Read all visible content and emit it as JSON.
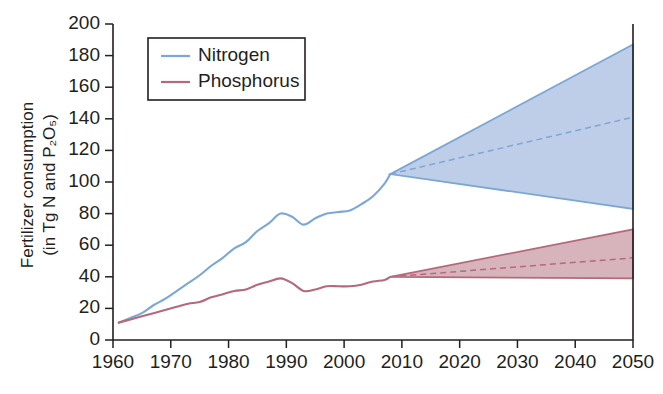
{
  "chart_data": {
    "type": "line",
    "title": "",
    "xlabel": "",
    "ylabel": "Fertilizer consumption (in Tg N and P2O5)",
    "ylabel_line1": "Fertilizer consumption",
    "ylabel_line2": "(in Tg N and P₂O₅)",
    "xlim": [
      1960,
      2050
    ],
    "ylim": [
      0,
      200
    ],
    "xticks": [
      1960,
      1970,
      1980,
      1990,
      2000,
      2010,
      2020,
      2030,
      2040,
      2050
    ],
    "yticks": [
      0,
      20,
      40,
      60,
      80,
      100,
      120,
      140,
      160,
      180,
      200
    ],
    "grid": false,
    "legend_position": "top-left",
    "legend": [
      {
        "label": "Nitrogen",
        "color": "#7BA7D7"
      },
      {
        "label": "Phosphorus",
        "color": "#B5697A"
      }
    ],
    "colors": {
      "nitrogen_line": "#7BA7D7",
      "nitrogen_fill": "#A8BEE2",
      "phosphorus_line": "#B5697A",
      "phosphorus_fill": "#C99AA4",
      "axis": "#231f20"
    },
    "projection_start_year": 2008,
    "series": [
      {
        "name": "Nitrogen",
        "kind": "historical",
        "x": [
          1961,
          1963,
          1965,
          1967,
          1969,
          1971,
          1973,
          1975,
          1977,
          1979,
          1981,
          1983,
          1985,
          1987,
          1989,
          1991,
          1993,
          1995,
          1997,
          1999,
          2001,
          2003,
          2005,
          2007,
          2008
        ],
        "values": [
          11,
          14,
          17,
          22,
          26,
          31,
          36,
          41,
          47,
          52,
          58,
          62,
          69,
          74,
          80,
          78,
          73,
          77,
          80,
          81,
          82,
          86,
          91,
          99,
          105
        ]
      },
      {
        "name": "Phosphorus",
        "kind": "historical",
        "x": [
          1961,
          1963,
          1965,
          1967,
          1969,
          1971,
          1973,
          1975,
          1977,
          1979,
          1981,
          1983,
          1985,
          1987,
          1989,
          1991,
          1993,
          1995,
          1997,
          1999,
          2001,
          2003,
          2005,
          2007,
          2008
        ],
        "values": [
          11,
          13,
          15,
          17,
          19,
          21,
          23,
          24,
          27,
          29,
          31,
          32,
          35,
          37,
          39,
          36,
          31,
          32,
          34,
          34,
          34,
          35,
          37,
          38,
          40
        ]
      },
      {
        "name": "Nitrogen projection",
        "kind": "projection_band",
        "x": [
          2008,
          2050
        ],
        "upper": [
          105,
          187
        ],
        "median": [
          105,
          141
        ],
        "lower": [
          105,
          83
        ]
      },
      {
        "name": "Phosphorus projection",
        "kind": "projection_band",
        "x": [
          2008,
          2050
        ],
        "upper": [
          40,
          70
        ],
        "median": [
          40,
          52
        ],
        "lower": [
          40,
          39
        ]
      }
    ]
  }
}
